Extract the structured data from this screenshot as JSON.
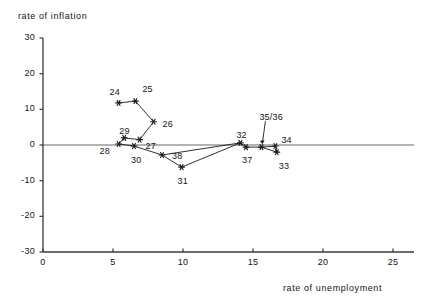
{
  "chart_data": {
    "type": "line",
    "title": "",
    "xlabel": "rate of unemployment",
    "ylabel": "rate of inflation",
    "xlim": [
      0,
      26.5
    ],
    "ylim": [
      -30,
      30
    ],
    "xticks": [
      0,
      5,
      10,
      15,
      20,
      25
    ],
    "yticks": [
      30,
      20,
      10,
      0,
      -10,
      -20,
      -30
    ],
    "xtick_labels": [
      "0",
      "5",
      "10",
      "15",
      "20",
      "25"
    ],
    "ytick_labels": [
      "30",
      "20",
      "10",
      "0",
      "-10",
      "-20",
      "-30"
    ],
    "grid": false,
    "legend": false,
    "zero_line": true,
    "marker": "star",
    "line_color": "#1a1a1a",
    "zero_line_color": "#9a9a9a",
    "axis_color": "#3a3a3a",
    "points": [
      {
        "label": "24",
        "x": 5.4,
        "y": 11.8,
        "lx": -9,
        "ly": -16
      },
      {
        "label": "25",
        "x": 6.6,
        "y": 12.3,
        "lx": 7,
        "ly": -17
      },
      {
        "label": "26",
        "x": 7.9,
        "y": 6.5,
        "lx": 9,
        "ly": -3
      },
      {
        "label": "27",
        "x": 6.9,
        "y": 1.5,
        "lx": 6,
        "ly": 1
      },
      {
        "label": "28",
        "x": 5.4,
        "y": 0.3,
        "lx": -19,
        "ly": 2
      },
      {
        "label": "29",
        "x": 5.8,
        "y": 2.0,
        "lx": -5,
        "ly": -12
      },
      {
        "label": "30",
        "x": 6.5,
        "y": -0.3,
        "lx": -3,
        "ly": 9
      },
      {
        "label": "31",
        "x": 9.9,
        "y": -6.2,
        "lx": -4,
        "ly": 9
      },
      {
        "label": "38",
        "x": 8.5,
        "y": -2.8,
        "lx": 10,
        "ly": -4
      },
      {
        "label": "32",
        "x": 14.1,
        "y": 0.6,
        "lx": -4,
        "ly": -13
      },
      {
        "label": "37",
        "x": 14.5,
        "y": -0.6,
        "lx": -4,
        "ly": 8
      },
      {
        "label": "35/36",
        "x": 15.6,
        "y": -0.6,
        "lx": -2,
        "ly": -35
      },
      {
        "label": "34",
        "x": 16.6,
        "y": -0.3,
        "lx": 6,
        "ly": -11
      },
      {
        "label": "33",
        "x": 16.7,
        "y": -2.0,
        "lx": 2,
        "ly": 9
      }
    ],
    "path_order": [
      "24",
      "25",
      "26",
      "27",
      "29",
      "28",
      "29",
      "27",
      "30",
      "31",
      "38",
      "32",
      "37",
      "35/36",
      "33",
      "34"
    ],
    "segments": [
      [
        "24",
        "25"
      ],
      [
        "25",
        "26"
      ],
      [
        "26",
        "27"
      ],
      [
        "27",
        "29"
      ],
      [
        "29",
        "28"
      ],
      [
        "28",
        "30"
      ],
      [
        "30",
        "38"
      ],
      [
        "38",
        "31"
      ],
      [
        "31",
        "32"
      ],
      [
        "38",
        "32"
      ],
      [
        "32",
        "37"
      ],
      [
        "37",
        "35/36"
      ],
      [
        "35/36",
        "33"
      ],
      [
        "33",
        "34"
      ],
      [
        "34",
        "35/36"
      ]
    ],
    "annotation_leader": {
      "from": "35/36",
      "label_offset_y": -30
    }
  }
}
